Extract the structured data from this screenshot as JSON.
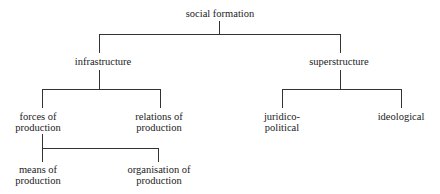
{
  "diagram": {
    "root": {
      "label": "social formation"
    },
    "infrastructure": {
      "label": "infrastructure"
    },
    "superstructure": {
      "label": "superstructure"
    },
    "forces": {
      "line1": "forces of",
      "line2": "production"
    },
    "relations": {
      "line1": "relations of",
      "line2": "production"
    },
    "juridico": {
      "line1": "juridico-",
      "line2": "political"
    },
    "ideological": {
      "label": "ideological"
    },
    "means": {
      "line1": "means of",
      "line2": "production"
    },
    "organisation": {
      "line1": "organisation of",
      "line2": "production"
    }
  }
}
